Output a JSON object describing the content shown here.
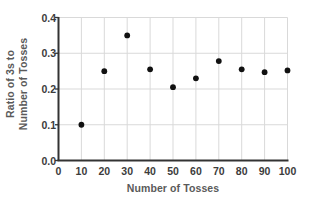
{
  "chart_data": {
    "type": "scatter",
    "title": "",
    "xlabel": "Number of Tosses",
    "ylabel_line1": "Ratio of 3s to",
    "ylabel_line2": "Number of Tosses",
    "xlim": [
      0,
      100
    ],
    "ylim": [
      0.0,
      0.4
    ],
    "xticks": [
      "0",
      "10",
      "20",
      "30",
      "40",
      "50",
      "60",
      "70",
      "80",
      "90",
      "100"
    ],
    "xtick_values": [
      0,
      10,
      20,
      30,
      40,
      50,
      60,
      70,
      80,
      90,
      100
    ],
    "yticks": [
      "0.0",
      "0.1",
      "0.2",
      "0.3",
      "0.4"
    ],
    "ytick_values": [
      0.0,
      0.1,
      0.2,
      0.3,
      0.4
    ],
    "grid": true,
    "grid_color": "#d9d9d9",
    "legend": "none",
    "marker_color": "#111111",
    "axis_color": "#333333",
    "x": [
      10,
      20,
      30,
      40,
      50,
      60,
      70,
      80,
      90,
      100
    ],
    "values": [
      0.1,
      0.25,
      0.35,
      0.255,
      0.205,
      0.23,
      0.278,
      0.255,
      0.247,
      0.252
    ],
    "points": [
      {
        "x": 10,
        "y": 0.1
      },
      {
        "x": 20,
        "y": 0.25
      },
      {
        "x": 30,
        "y": 0.35
      },
      {
        "x": 40,
        "y": 0.255
      },
      {
        "x": 50,
        "y": 0.205
      },
      {
        "x": 60,
        "y": 0.23
      },
      {
        "x": 70,
        "y": 0.278
      },
      {
        "x": 80,
        "y": 0.255
      },
      {
        "x": 90,
        "y": 0.247
      },
      {
        "x": 100,
        "y": 0.252
      }
    ]
  }
}
